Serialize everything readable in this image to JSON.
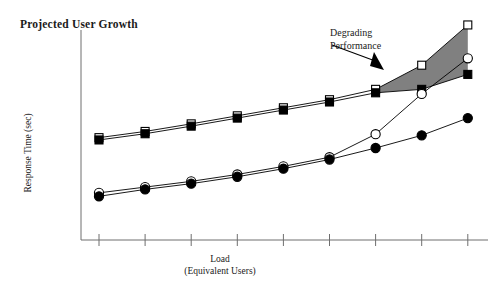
{
  "chart_data": {
    "type": "line",
    "title": "Projected User Growth",
    "xlabel_line1": "Load",
    "xlabel_line2": "(Equivalent Users)",
    "ylabel": "Response Time (sec)",
    "x": [
      1,
      2,
      3,
      4,
      5,
      6,
      7,
      8,
      9
    ],
    "xlim": [
      0.6,
      9.4
    ],
    "ylim": [
      0,
      10
    ],
    "grid": false,
    "legend": "none",
    "xtick_labels": [
      "",
      "",
      "",
      "",
      "",
      "",
      "",
      "",
      ""
    ],
    "ytick_labels": [],
    "series": [
      {
        "name": "open-square",
        "marker": "open-square",
        "color": "#000000",
        "values": [
          4.45,
          4.72,
          5.05,
          5.4,
          5.75,
          6.1,
          6.55,
          7.6,
          9.35
        ]
      },
      {
        "name": "filled-square",
        "marker": "filled-square",
        "color": "#000000",
        "values": [
          4.35,
          4.62,
          4.95,
          5.3,
          5.65,
          6.0,
          6.4,
          6.55,
          7.2
        ]
      },
      {
        "name": "open-circle",
        "marker": "open-circle",
        "color": "#000000",
        "values": [
          2.05,
          2.3,
          2.55,
          2.85,
          3.2,
          3.6,
          4.6,
          6.35,
          7.9
        ]
      },
      {
        "name": "filled-circle",
        "marker": "filled-circle",
        "color": "#000000",
        "values": [
          1.9,
          2.2,
          2.45,
          2.75,
          3.1,
          3.5,
          4.0,
          4.55,
          5.3
        ]
      }
    ],
    "shaded_region": {
      "label_line1": "Degrading",
      "label_line2": "Performance",
      "fill_color": "#808080",
      "between": [
        "open-square",
        "filled-square"
      ],
      "x_start": 7,
      "x_end": 9
    },
    "annotation_arrow": {
      "name": "degrading-performance-arrow",
      "points_to": "shaded-region"
    }
  }
}
